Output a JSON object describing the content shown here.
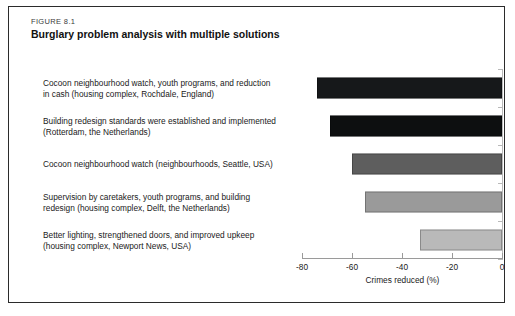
{
  "figure": {
    "number": "FIGURE 8.1",
    "title": "Burglary problem analysis with multiple solutions"
  },
  "chart_data": {
    "type": "bar",
    "orientation": "horizontal",
    "title": "Burglary problem analysis with multiple solutions",
    "xlabel": "Crimes reduced (%)",
    "ylabel": "",
    "xlim": [
      -80,
      0
    ],
    "xticks": [
      -80,
      -60,
      -40,
      -20,
      0
    ],
    "xtick_labels": [
      "-80",
      "-60",
      "-40",
      "-20",
      "0"
    ],
    "grid": false,
    "legend": "none",
    "categories": [
      "Cocoon neighbourhood watch, youth programs, and reduction in cash (housing complex, Rochdale, England)",
      "Building redesign standards were established and implemented (Rotterdam, the Netherlands)",
      "Cocoon neighbourhood watch (neighbourhoods, Seattle, USA)",
      "Supervision by caretakers, youth programs, and building redesign (housing complex, Delft, the Netherlands)",
      "Better lighting, strengthened doors, and improved upkeep (housing complex, Newport News, USA)"
    ],
    "values": [
      -74,
      -69,
      -60,
      -55,
      -33
    ],
    "colors": [
      "#16181a",
      "#0d0f10",
      "#5e5e5e",
      "#9a9a9a",
      "#b9b9b9"
    ],
    "bars": [
      {
        "label_line1": "Cocoon neighbourhood watch, youth programs, and reduction",
        "label_line2": "in cash (housing complex, Rochdale, England)",
        "value": -74,
        "color": "#16181a"
      },
      {
        "label_line1": "Building redesign standards were established and implemented",
        "label_line2": "(Rotterdam, the Netherlands)",
        "value": -69,
        "color": "#0d0f10"
      },
      {
        "label_line1": "Cocoon neighbourhood watch (neighbourhoods, Seattle, USA)",
        "label_line2": "",
        "value": -60,
        "color": "#5e5e5e"
      },
      {
        "label_line1": "Supervision by caretakers, youth programs, and building",
        "label_line2": "redesign (housing complex, Delft, the Netherlands)",
        "value": -55,
        "color": "#9a9a9a"
      },
      {
        "label_line1": "Better lighting, strengthened doors, and improved upkeep",
        "label_line2": "(housing complex, Newport News, USA)",
        "value": -33,
        "color": "#b9b9b9"
      }
    ]
  }
}
